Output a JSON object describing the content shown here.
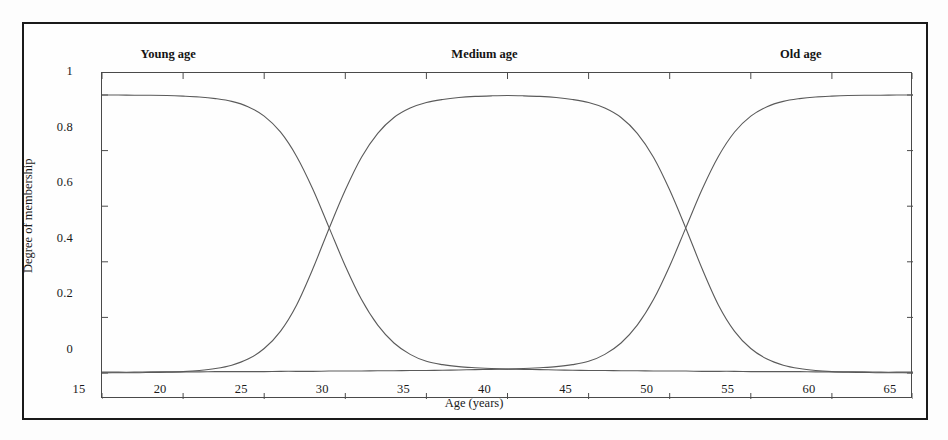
{
  "figure": {
    "type": "fuzzy-membership-plot",
    "background_color": "#fdfdfd",
    "frame_color": "#1a1a1a",
    "curve_color": "#5a5a5a"
  },
  "chart_data": {
    "type": "line",
    "title": "",
    "subtitle": "",
    "xlabel": "Age (years)",
    "ylabel": "Degree of membership",
    "xlim": [
      15,
      65
    ],
    "ylim": [
      0,
      1
    ],
    "xticks": [
      15,
      20,
      25,
      30,
      35,
      40,
      45,
      50,
      55,
      60,
      65
    ],
    "xticklabels": [
      "15",
      "20",
      "25",
      "30",
      "35",
      "40",
      "45",
      "50",
      "55",
      "60",
      "65"
    ],
    "yticks": [
      0,
      0.2,
      0.4,
      0.6,
      0.8,
      1
    ],
    "yticklabels": [
      "0",
      "0.2",
      "0.4",
      "0.6",
      "0.8",
      "1"
    ],
    "grid": false,
    "legend": "inline-annotations",
    "annotations": [
      {
        "text": "Young age",
        "x": 20.5,
        "y": 1.06
      },
      {
        "text": "Medium age",
        "x": 40.0,
        "y": 1.06
      },
      {
        "text": "Old age",
        "x": 59.5,
        "y": 1.06
      }
    ],
    "x": [
      15,
      16,
      17,
      18,
      19,
      20,
      21,
      22,
      23,
      24,
      25,
      26,
      27,
      28,
      29,
      30,
      31,
      32,
      33,
      34,
      35,
      36,
      37,
      38,
      39,
      40,
      41,
      42,
      43,
      44,
      45,
      46,
      47,
      48,
      49,
      50,
      51,
      52,
      53,
      54,
      55,
      56,
      57,
      58,
      59,
      60,
      61,
      62,
      63,
      64,
      65
    ],
    "series": [
      {
        "name": "Young age",
        "values": [
          1.0,
          1.0,
          0.999,
          0.999,
          0.998,
          0.996,
          0.993,
          0.987,
          0.977,
          0.958,
          0.924,
          0.867,
          0.779,
          0.661,
          0.523,
          0.385,
          0.264,
          0.172,
          0.108,
          0.067,
          0.042,
          0.03,
          0.023,
          0.019,
          0.016,
          0.014,
          0.013,
          0.012,
          0.011,
          0.01,
          0.009,
          0.009,
          0.008,
          0.008,
          0.007,
          0.007,
          0.007,
          0.006,
          0.006,
          0.006,
          0.005,
          0.005,
          0.005,
          0.005,
          0.004,
          0.004,
          0.004,
          0.004,
          0.003,
          0.003,
          0.003
        ]
      },
      {
        "name": "Medium age",
        "values": [
          0.0,
          0.001,
          0.001,
          0.002,
          0.003,
          0.005,
          0.009,
          0.016,
          0.028,
          0.05,
          0.088,
          0.15,
          0.245,
          0.375,
          0.52,
          0.658,
          0.776,
          0.862,
          0.919,
          0.953,
          0.973,
          0.984,
          0.991,
          0.995,
          0.997,
          0.998,
          0.997,
          0.995,
          0.991,
          0.984,
          0.973,
          0.953,
          0.919,
          0.862,
          0.776,
          0.658,
          0.52,
          0.375,
          0.245,
          0.15,
          0.088,
          0.05,
          0.028,
          0.016,
          0.009,
          0.005,
          0.003,
          0.002,
          0.001,
          0.001,
          0.0
        ]
      },
      {
        "name": "Old age",
        "values": [
          0.003,
          0.003,
          0.003,
          0.004,
          0.004,
          0.004,
          0.004,
          0.005,
          0.005,
          0.005,
          0.005,
          0.006,
          0.006,
          0.006,
          0.007,
          0.007,
          0.007,
          0.008,
          0.008,
          0.009,
          0.009,
          0.01,
          0.011,
          0.012,
          0.013,
          0.014,
          0.016,
          0.019,
          0.023,
          0.03,
          0.042,
          0.067,
          0.108,
          0.172,
          0.264,
          0.385,
          0.523,
          0.661,
          0.779,
          0.867,
          0.924,
          0.958,
          0.977,
          0.987,
          0.993,
          0.996,
          0.998,
          0.999,
          0.999,
          1.0,
          1.0
        ]
      }
    ],
    "crossovers": [
      {
        "x": 30,
        "y": 0.5,
        "between": [
          "Young age",
          "Medium age"
        ]
      },
      {
        "x": 50,
        "y": 0.5,
        "between": [
          "Medium age",
          "Old age"
        ]
      },
      {
        "x": 40,
        "y": 0.05,
        "between": [
          "Young age",
          "Old age"
        ]
      }
    ]
  }
}
